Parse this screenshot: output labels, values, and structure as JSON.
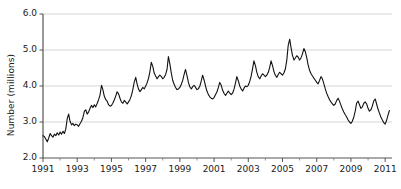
{
  "chart_data": {
    "type": "line",
    "title": "",
    "subtitle": "",
    "xlabel": "",
    "ylabel": "Number (millions)",
    "xlim": [
      1991.0,
      2011.4
    ],
    "ylim": [
      2.0,
      6.0
    ],
    "yticks": [
      2.0,
      3.0,
      4.0,
      5.0,
      6.0
    ],
    "ytick_labels": [
      "2.0",
      "3.0",
      "4.0",
      "5.0",
      "6.0"
    ],
    "xticks": [
      1991,
      1993,
      1995,
      1997,
      1999,
      2001,
      2003,
      2005,
      2007,
      2009,
      2011
    ],
    "xtick_labels": [
      "1991",
      "1993",
      "1995",
      "1997",
      "1999",
      "2001",
      "2003",
      "2005",
      "2007",
      "2009",
      "2011"
    ],
    "xminor_ticks": [
      1992,
      1994,
      1996,
      1998,
      2000,
      2002,
      2004,
      2006,
      2008,
      2010
    ],
    "grid": "horizontal",
    "grid_color": "#cccccc",
    "line_color": "#111111",
    "line_width": 1.1,
    "legend": null,
    "legend_position": "none",
    "annotations": [],
    "series": [
      {
        "name": "Number (millions)",
        "x": [
          1991.0,
          1991.08,
          1991.17,
          1991.25,
          1991.33,
          1991.42,
          1991.5,
          1991.58,
          1991.67,
          1991.75,
          1991.83,
          1991.92,
          1992.0,
          1992.08,
          1992.17,
          1992.25,
          1992.33,
          1992.42,
          1992.5,
          1992.58,
          1992.67,
          1992.75,
          1992.83,
          1992.92,
          1993.0,
          1993.08,
          1993.17,
          1993.25,
          1993.33,
          1993.42,
          1993.5,
          1993.58,
          1993.67,
          1993.75,
          1993.83,
          1993.92,
          1994.0,
          1994.08,
          1994.17,
          1994.25,
          1994.33,
          1994.42,
          1994.5,
          1994.58,
          1994.67,
          1994.75,
          1994.83,
          1994.92,
          1995.0,
          1995.08,
          1995.17,
          1995.25,
          1995.33,
          1995.42,
          1995.5,
          1995.58,
          1995.67,
          1995.75,
          1995.83,
          1995.92,
          1996.0,
          1996.08,
          1996.17,
          1996.25,
          1996.33,
          1996.42,
          1996.5,
          1996.58,
          1996.67,
          1996.75,
          1996.83,
          1996.92,
          1997.0,
          1997.08,
          1997.17,
          1997.25,
          1997.33,
          1997.42,
          1997.5,
          1997.58,
          1997.67,
          1997.75,
          1997.83,
          1997.92,
          1998.0,
          1998.08,
          1998.17,
          1998.25,
          1998.33,
          1998.42,
          1998.5,
          1998.58,
          1998.67,
          1998.75,
          1998.83,
          1998.92,
          1999.0,
          1999.08,
          1999.17,
          1999.25,
          1999.33,
          1999.42,
          1999.5,
          1999.58,
          1999.67,
          1999.75,
          1999.83,
          1999.92,
          2000.0,
          2000.08,
          2000.17,
          2000.25,
          2000.33,
          2000.42,
          2000.5,
          2000.58,
          2000.67,
          2000.75,
          2000.83,
          2000.92,
          2001.0,
          2001.08,
          2001.17,
          2001.25,
          2001.33,
          2001.42,
          2001.5,
          2001.58,
          2001.67,
          2001.75,
          2001.83,
          2001.92,
          2002.0,
          2002.08,
          2002.17,
          2002.25,
          2002.33,
          2002.42,
          2002.5,
          2002.58,
          2002.67,
          2002.75,
          2002.83,
          2002.92,
          2003.0,
          2003.08,
          2003.17,
          2003.25,
          2003.33,
          2003.42,
          2003.5,
          2003.58,
          2003.67,
          2003.75,
          2003.83,
          2003.92,
          2004.0,
          2004.08,
          2004.17,
          2004.25,
          2004.33,
          2004.42,
          2004.5,
          2004.58,
          2004.67,
          2004.75,
          2004.83,
          2004.92,
          2005.0,
          2005.08,
          2005.17,
          2005.25,
          2005.33,
          2005.42,
          2005.5,
          2005.58,
          2005.67,
          2005.75,
          2005.83,
          2005.92,
          2006.0,
          2006.08,
          2006.17,
          2006.25,
          2006.33,
          2006.42,
          2006.5,
          2006.58,
          2006.67,
          2006.75,
          2006.83,
          2006.92,
          2007.0,
          2007.08,
          2007.17,
          2007.25,
          2007.33,
          2007.42,
          2007.5,
          2007.58,
          2007.67,
          2007.75,
          2007.83,
          2007.92,
          2008.0,
          2008.08,
          2008.17,
          2008.25,
          2008.33,
          2008.42,
          2008.5,
          2008.58,
          2008.67,
          2008.75,
          2008.83,
          2008.92,
          2009.0,
          2009.08,
          2009.17,
          2009.25,
          2009.33,
          2009.42,
          2009.5,
          2009.58,
          2009.67,
          2009.75,
          2009.83,
          2009.92,
          2010.0,
          2010.08,
          2010.17,
          2010.25,
          2010.33,
          2010.42,
          2010.5,
          2010.58,
          2010.67,
          2010.75,
          2010.83,
          2010.92,
          2011.0,
          2011.08,
          2011.17,
          2011.25
        ],
        "y": [
          2.62,
          2.6,
          2.52,
          2.45,
          2.55,
          2.68,
          2.62,
          2.58,
          2.66,
          2.62,
          2.7,
          2.64,
          2.72,
          2.66,
          2.74,
          2.68,
          2.8,
          3.1,
          3.22,
          3.02,
          2.92,
          2.96,
          2.9,
          2.94,
          2.92,
          2.88,
          2.96,
          3.02,
          3.12,
          3.3,
          3.34,
          3.22,
          3.28,
          3.38,
          3.46,
          3.4,
          3.48,
          3.42,
          3.52,
          3.62,
          3.74,
          4.02,
          3.9,
          3.72,
          3.62,
          3.58,
          3.48,
          3.44,
          3.46,
          3.52,
          3.62,
          3.72,
          3.84,
          3.78,
          3.66,
          3.56,
          3.52,
          3.6,
          3.56,
          3.5,
          3.56,
          3.62,
          3.74,
          3.9,
          4.1,
          4.24,
          4.06,
          3.92,
          3.84,
          3.9,
          3.96,
          3.92,
          4.0,
          4.08,
          4.22,
          4.4,
          4.66,
          4.54,
          4.36,
          4.28,
          4.2,
          4.26,
          4.3,
          4.26,
          4.2,
          4.24,
          4.32,
          4.46,
          4.82,
          4.6,
          4.36,
          4.16,
          4.04,
          3.96,
          3.9,
          3.92,
          3.96,
          4.04,
          4.16,
          4.32,
          4.46,
          4.28,
          4.1,
          3.98,
          3.92,
          3.98,
          4.02,
          3.96,
          3.9,
          3.92,
          4.0,
          4.14,
          4.3,
          4.16,
          4.0,
          3.86,
          3.76,
          3.7,
          3.66,
          3.64,
          3.68,
          3.76,
          3.84,
          3.96,
          4.1,
          4.02,
          3.88,
          3.8,
          3.74,
          3.8,
          3.86,
          3.8,
          3.76,
          3.8,
          3.92,
          4.08,
          4.26,
          4.14,
          4.0,
          3.92,
          3.86,
          3.94,
          4.0,
          3.98,
          4.02,
          4.12,
          4.28,
          4.48,
          4.7,
          4.56,
          4.38,
          4.26,
          4.2,
          4.28,
          4.34,
          4.3,
          4.26,
          4.3,
          4.38,
          4.52,
          4.7,
          4.56,
          4.4,
          4.3,
          4.24,
          4.32,
          4.38,
          4.34,
          4.3,
          4.36,
          4.48,
          4.72,
          5.12,
          5.3,
          5.06,
          4.86,
          4.72,
          4.78,
          4.84,
          4.8,
          4.72,
          4.78,
          4.9,
          5.04,
          4.96,
          4.78,
          4.58,
          4.44,
          4.34,
          4.28,
          4.22,
          4.16,
          4.1,
          4.06,
          4.16,
          4.26,
          4.2,
          4.06,
          3.92,
          3.8,
          3.7,
          3.62,
          3.56,
          3.5,
          3.46,
          3.5,
          3.6,
          3.66,
          3.58,
          3.46,
          3.36,
          3.28,
          3.2,
          3.14,
          3.06,
          3.0,
          2.96,
          3.02,
          3.14,
          3.3,
          3.52,
          3.58,
          3.48,
          3.38,
          3.42,
          3.52,
          3.56,
          3.5,
          3.38,
          3.3,
          3.34,
          3.44,
          3.58,
          3.64,
          3.5,
          3.36,
          3.24,
          3.14,
          3.06,
          2.98,
          2.94,
          3.04,
          3.2,
          3.32
        ]
      }
    ]
  }
}
